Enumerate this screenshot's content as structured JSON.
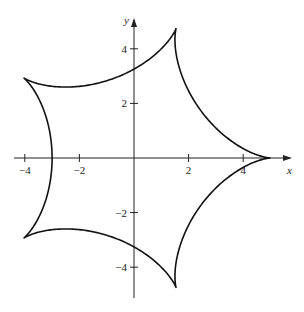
{
  "chart_data": {
    "type": "line",
    "title": "",
    "xlabel": "x",
    "ylabel": "y",
    "xlim": [
      -4.2,
      5.6
    ],
    "ylim": [
      -5.2,
      5.1
    ],
    "grid": false,
    "x_ticks": [
      -4,
      -2,
      2,
      4
    ],
    "y_ticks": [
      4,
      2,
      -2,
      -4
    ],
    "x_tick_labels": [
      "−4",
      "−2",
      "2",
      "4"
    ],
    "y_tick_labels": [
      "4",
      "2",
      "−2",
      "−4"
    ],
    "curve": {
      "name": "hypocycloid (5 cusps)",
      "param": "x = 4cos t + cos 4t, y = 4sin t − sin 4t, 0 ≤ t ≤ 2π",
      "cusps": [
        [
          5,
          0
        ],
        [
          1.55,
          4.76
        ],
        [
          -4.05,
          2.94
        ],
        [
          -4.05,
          -2.94
        ],
        [
          1.55,
          -4.76
        ]
      ]
    }
  },
  "axes": {
    "x_label": "x",
    "y_label": "y"
  },
  "style": {
    "line_color": "#111111",
    "axis_color": "#222222"
  }
}
